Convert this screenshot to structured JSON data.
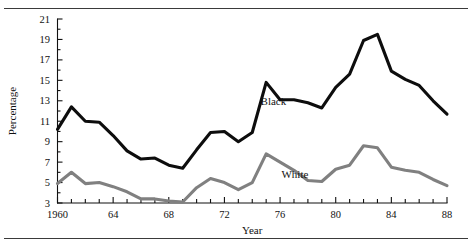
{
  "figure": {
    "has_top_rule": true,
    "has_bottom_rule": true,
    "background": "#ffffff"
  },
  "chart_data": {
    "type": "line",
    "title": "",
    "subtitle": "",
    "xlabel": "Year",
    "ylabel": "Percentage",
    "xlim": [
      1960,
      1988
    ],
    "ylim": [
      3,
      21
    ],
    "grid": false,
    "legend_position": "inline-annotation",
    "x_tick_values": [
      1960,
      1961,
      1962,
      1963,
      1964,
      1965,
      1966,
      1967,
      1968,
      1969,
      1970,
      1971,
      1972,
      1973,
      1974,
      1975,
      1976,
      1977,
      1978,
      1979,
      1980,
      1981,
      1982,
      1983,
      1984,
      1985,
      1986,
      1987,
      1988
    ],
    "x_tick_labels": [
      {
        "value": 1960,
        "label": "1960"
      },
      {
        "value": 1964,
        "label": "64"
      },
      {
        "value": 1968,
        "label": "68"
      },
      {
        "value": 1972,
        "label": "72"
      },
      {
        "value": 1976,
        "label": "76"
      },
      {
        "value": 1980,
        "label": "80"
      },
      {
        "value": 1984,
        "label": "84"
      },
      {
        "value": 1988,
        "label": "88"
      }
    ],
    "y_tick_values": [
      3,
      5,
      7,
      9,
      11,
      13,
      15,
      17,
      19,
      21
    ],
    "y_tick_labels": [
      "3",
      "5",
      "7",
      "9",
      "11",
      "13",
      "15",
      "17",
      "19",
      "21"
    ],
    "y_minor_ticks": [
      4,
      6,
      8,
      10,
      12,
      14,
      16,
      18,
      20
    ],
    "x": [
      1960,
      1961,
      1962,
      1963,
      1964,
      1965,
      1966,
      1967,
      1968,
      1969,
      1970,
      1971,
      1972,
      1973,
      1974,
      1975,
      1976,
      1977,
      1978,
      1979,
      1980,
      1981,
      1982,
      1983,
      1984,
      1985,
      1986,
      1987,
      1988
    ],
    "series": [
      {
        "name": "Black",
        "color": "#0d0d0d",
        "stroke_width": 3.1,
        "label_x": 1974.6,
        "label_y": 12.6,
        "values": [
          10.2,
          12.4,
          11.0,
          10.9,
          9.6,
          8.1,
          7.3,
          7.4,
          6.7,
          6.4,
          8.2,
          9.9,
          10.0,
          9.0,
          9.9,
          14.8,
          13.1,
          13.1,
          12.8,
          12.3,
          14.3,
          15.6,
          18.9,
          19.5,
          15.9,
          15.1,
          14.5,
          13.0,
          11.7
        ]
      },
      {
        "name": "White",
        "color": "#808080",
        "stroke_width": 3.1,
        "label_x": 1976.1,
        "label_y": 5.4,
        "values": [
          4.9,
          6.0,
          4.9,
          5.0,
          4.6,
          4.1,
          3.4,
          3.4,
          3.2,
          3.1,
          4.5,
          5.4,
          5.0,
          4.3,
          5.0,
          7.8,
          7.0,
          6.2,
          5.2,
          5.1,
          6.3,
          6.7,
          8.6,
          8.4,
          6.5,
          6.2,
          6.0,
          5.3,
          4.7
        ]
      }
    ]
  }
}
